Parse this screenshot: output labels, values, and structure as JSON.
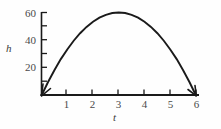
{
  "chart_data": {
    "type": "line",
    "title": "",
    "subtitle": "",
    "xlabel": "t",
    "ylabel": "h",
    "xlim": [
      0,
      6
    ],
    "ylim": [
      0,
      60
    ],
    "grid": false,
    "legend": null,
    "x_ticks": [
      {
        "value": 1,
        "label": "1"
      },
      {
        "value": 2,
        "label": "2"
      },
      {
        "value": 3,
        "label": "3"
      },
      {
        "value": 4,
        "label": "4"
      },
      {
        "value": 5,
        "label": "5"
      },
      {
        "value": 6,
        "label": "6"
      }
    ],
    "y_ticks": [
      {
        "value": 10,
        "label": ""
      },
      {
        "value": 20,
        "label": "20"
      },
      {
        "value": 30,
        "label": ""
      },
      {
        "value": 40,
        "label": "40"
      },
      {
        "value": 50,
        "label": ""
      },
      {
        "value": 60,
        "label": "60"
      }
    ],
    "series": [
      {
        "name": "h(t)",
        "x": [
          0,
          0.25,
          0.5,
          0.75,
          1,
          1.25,
          1.5,
          1.75,
          2,
          2.25,
          2.5,
          2.75,
          3,
          3.25,
          3.5,
          3.75,
          4,
          4.25,
          4.5,
          4.75,
          5,
          5.25,
          5.5,
          5.75,
          6
        ],
        "values": [
          0,
          9.6,
          18.3,
          26.3,
          33.3,
          39.6,
          45,
          49.6,
          53.3,
          56.3,
          58.3,
          59.6,
          60,
          59.6,
          58.3,
          56.3,
          53.3,
          49.6,
          45,
          39.6,
          33.3,
          26.3,
          18.3,
          9.6,
          0
        ],
        "color": "#1a1a1a",
        "start_arrow": true,
        "end_arrow": true
      }
    ],
    "annotations": []
  },
  "axis_labels": {
    "y_name": "h",
    "x_name": "t"
  },
  "colors": {
    "axis": "#1a1a1a",
    "curve": "#1a1a1a",
    "tick_text": "#4a4a4a",
    "background": "#fefefe"
  }
}
